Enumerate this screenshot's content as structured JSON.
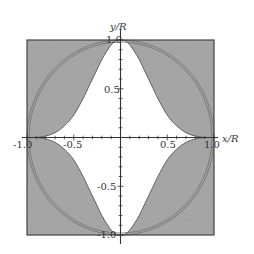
{
  "chart_data": {
    "type": "area",
    "title": "",
    "xlabel": "x/R",
    "ylabel": "y/R",
    "xlim": [
      -1.0,
      1.0
    ],
    "ylim": [
      -1.0,
      1.0
    ],
    "x_ticks": [
      "-1.0",
      "-0.5",
      "0.5",
      "1.0"
    ],
    "y_ticks": [
      "1.0",
      "0.5",
      "-0.5",
      "-1.0"
    ],
    "grid": false,
    "legend": null,
    "series": [
      {
        "name": "white region boundary (first quadrant, mirrored to all quadrants)",
        "x": [
          0.0,
          0.05,
          0.1,
          0.15,
          0.2,
          0.25,
          0.3,
          0.35,
          0.4,
          0.5,
          0.6,
          0.7,
          0.8,
          0.9
        ],
        "y": [
          1.0,
          0.99,
          0.95,
          0.88,
          0.8,
          0.7,
          0.6,
          0.5,
          0.4,
          0.23,
          0.12,
          0.05,
          0.015,
          0.0
        ]
      },
      {
        "name": "unit circle (double line)",
        "radius": 1.0
      }
    ],
    "colors": {
      "shade": "#a6a6a6",
      "background": "#ffffff",
      "lines": "#555555"
    }
  },
  "axes": {
    "x_label": "x/R",
    "y_label": "y/R",
    "x_tick_labels": [
      "-1.0",
      "-0.5",
      "0.5",
      "1.0"
    ],
    "y_tick_labels": [
      "1.0",
      "0.5",
      "-0.5",
      "-1.0"
    ]
  }
}
